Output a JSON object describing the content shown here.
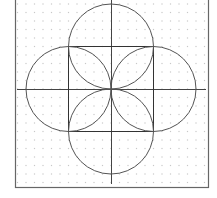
{
  "diagram": {
    "title": "",
    "frame": {
      "left": 15,
      "right": 208,
      "top": -2,
      "bottom": 187,
      "stroke": "#666666"
    },
    "grid": {
      "spacing": 8.5,
      "origin_x": 111,
      "origin_y": 89,
      "dot_color": "#c8c8c8"
    },
    "center": {
      "x": 111,
      "y": 89
    },
    "axes": {
      "horizontal": {
        "x1": 17,
        "x2": 206,
        "y": 89
      },
      "vertical": {
        "x": 111,
        "y1": 0,
        "y2": 184
      },
      "stroke": "#444444"
    },
    "square": {
      "x": 68.5,
      "y": 46.5,
      "size": 85,
      "stroke": "#333333"
    },
    "circles": [
      {
        "name": "top",
        "cx": 111,
        "cy": 46.5,
        "r": 42.5
      },
      {
        "name": "bottom",
        "cx": 111,
        "cy": 131.5,
        "r": 42.5
      },
      {
        "name": "left",
        "cx": 68.5,
        "cy": 89,
        "r": 42.5
      },
      {
        "name": "right",
        "cx": 153.5,
        "cy": 89,
        "r": 42.5
      }
    ],
    "circle_stroke": "#555555"
  }
}
